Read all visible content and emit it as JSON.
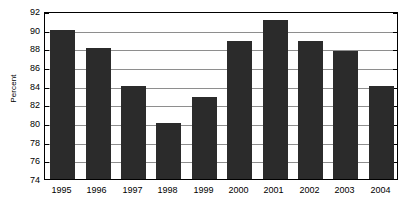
{
  "chart_data": {
    "type": "bar",
    "title": "",
    "xlabel": "",
    "ylabel": "Percent",
    "ylim": [
      74,
      92
    ],
    "yticks": [
      74,
      76,
      78,
      80,
      82,
      84,
      86,
      88,
      90,
      92
    ],
    "grid": true,
    "legend": false,
    "bar_color": "#2b2b2b",
    "categories": [
      "1995",
      "1996",
      "1997",
      "1998",
      "1999",
      "2000",
      "2001",
      "2002",
      "2003",
      "2004"
    ],
    "values": [
      90,
      88,
      84,
      80,
      82.8,
      88.8,
      91,
      88.8,
      87.7,
      84
    ],
    "series": [
      {
        "name": "Percent",
        "values": [
          90,
          88,
          84,
          80,
          82.8,
          88.8,
          91,
          88.8,
          87.7,
          84
        ]
      }
    ]
  },
  "axes": {
    "y_tick_labels": [
      "92",
      "90",
      "88",
      "86",
      "84",
      "82",
      "80",
      "78",
      "76",
      "74"
    ],
    "y_axis_title": "Percent",
    "x_tick_labels": [
      "1995",
      "1996",
      "1997",
      "1998",
      "1999",
      "2000",
      "2001",
      "2002",
      "2003",
      "2004"
    ]
  }
}
